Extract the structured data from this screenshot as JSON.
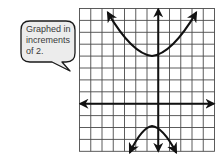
{
  "callout": {
    "lines": [
      "Graphed in",
      "increments",
      "of 2."
    ],
    "fill": "#ececec",
    "stroke": "#1a1a1a"
  },
  "graph": {
    "grid": {
      "left": 79.5,
      "top": 8.5,
      "cell_w": 11.25,
      "cell_h": 11.9,
      "cols": 12,
      "rows": 12,
      "yaxis_col": 7,
      "xaxis_row": 8,
      "line_color": "#4a4a4a",
      "axis_color": "#111111"
    },
    "increment": 2,
    "curves": [
      {
        "name": "upper-parabola",
        "opens": "up",
        "vertex_px": [
          152,
          56
        ],
        "left_arrow_px": [
          108,
          13
        ],
        "right_arrow_px": [
          196,
          13
        ]
      },
      {
        "name": "lower-parabola",
        "opens": "down",
        "vertex_px": [
          152,
          126
        ],
        "left_arrow_px": [
          130,
          152
        ],
        "right_arrow_px": [
          176,
          152
        ]
      }
    ],
    "curve_color": "#111111"
  }
}
